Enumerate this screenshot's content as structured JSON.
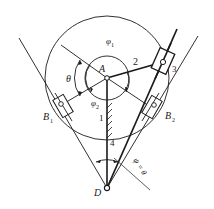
{
  "diagram": {
    "type": "mechanism-kinematic-sketch",
    "colors": {
      "line": "#1a1a1a",
      "background": "#ffffff"
    },
    "labels": {
      "pivot_A": "A",
      "pivot_D": "D",
      "position_B1": "B",
      "position_B1_sub": "1",
      "position_B2": "B",
      "position_B2_sub": "2",
      "link_1": "1",
      "link_2": "2",
      "link_3": "3",
      "link_4": "4",
      "angle_theta": "θ",
      "angle_phi1": "φ",
      "angle_phi1_sub": "1",
      "angle_phi2": "φ",
      "angle_phi2_sub": "2",
      "angle_psi": "ψ = θ"
    }
  }
}
